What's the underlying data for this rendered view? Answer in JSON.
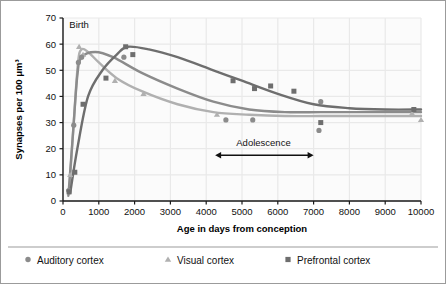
{
  "chart_data": {
    "type": "scatter",
    "title": "",
    "xlabel": "Age in days from conception",
    "ylabel": "Synapses per 100 μm³",
    "xlim": [
      0,
      10000
    ],
    "ylim": [
      0,
      70
    ],
    "xticks": [
      0,
      1000,
      2000,
      3000,
      4000,
      5000,
      6000,
      7000,
      8000,
      9000,
      10000
    ],
    "xtick_labels": [
      "0",
      "1000",
      "2000",
      "3000",
      "4000",
      "5000",
      "6000",
      "7000",
      "8000",
      "9000",
      "10000"
    ],
    "yticks": [
      0,
      10,
      20,
      30,
      40,
      50,
      60,
      70
    ],
    "ytick_labels": [
      "0",
      "10",
      "20",
      "30",
      "40",
      "50",
      "60",
      "70"
    ],
    "grid": true,
    "grid_color": "#e9e9e9",
    "legend_position": "below-plot",
    "annotations": [
      {
        "name": "birth",
        "text": "Birth",
        "x": 450,
        "y": 66
      },
      {
        "name": "adolescence",
        "text": "Adolescence",
        "x": 5600,
        "y": 21,
        "arrow": {
          "x_start": 4250,
          "x_end": 7000,
          "y": 17.5,
          "double_headed": true
        }
      }
    ],
    "series": [
      {
        "name": "Auditory cortex",
        "marker": "circle",
        "color": "#8b8b8b",
        "points": [
          {
            "x": 160,
            "y": 4
          },
          {
            "x": 300,
            "y": 29
          },
          {
            "x": 430,
            "y": 53
          },
          {
            "x": 520,
            "y": 55
          },
          {
            "x": 1700,
            "y": 55
          },
          {
            "x": 4550,
            "y": 31
          },
          {
            "x": 5300,
            "y": 31
          },
          {
            "x": 7150,
            "y": 27
          },
          {
            "x": 7200,
            "y": 38
          }
        ],
        "curve": [
          [
            150,
            2
          ],
          [
            280,
            26
          ],
          [
            400,
            48
          ],
          [
            520,
            55
          ],
          [
            900,
            57
          ],
          [
            1400,
            55
          ],
          [
            2200,
            49
          ],
          [
            3200,
            43
          ],
          [
            4200,
            38
          ],
          [
            5200,
            35
          ],
          [
            6200,
            34
          ],
          [
            7200,
            34
          ],
          [
            8200,
            34
          ],
          [
            9200,
            34
          ],
          [
            10000,
            34
          ]
        ]
      },
      {
        "name": "Visual cortex",
        "marker": "triangle",
        "color": "#b0b0b0",
        "points": [
          {
            "x": 200,
            "y": 10
          },
          {
            "x": 450,
            "y": 59
          },
          {
            "x": 560,
            "y": 56
          },
          {
            "x": 1450,
            "y": 46
          },
          {
            "x": 2250,
            "y": 41
          },
          {
            "x": 4300,
            "y": 33
          },
          {
            "x": 9750,
            "y": 33.5
          },
          {
            "x": 10000,
            "y": 31
          }
        ],
        "curve": [
          [
            170,
            3
          ],
          [
            300,
            30
          ],
          [
            420,
            53
          ],
          [
            520,
            58
          ],
          [
            700,
            57
          ],
          [
            1000,
            53
          ],
          [
            1500,
            47
          ],
          [
            2200,
            42
          ],
          [
            3200,
            37
          ],
          [
            4200,
            34
          ],
          [
            5200,
            33
          ],
          [
            6200,
            32.5
          ],
          [
            7200,
            32.5
          ],
          [
            8200,
            32.5
          ],
          [
            9200,
            32.5
          ],
          [
            10000,
            32.5
          ]
        ]
      },
      {
        "name": "Prefrontal cortex",
        "marker": "square",
        "color": "#6e6e6e",
        "points": [
          {
            "x": 170,
            "y": 3.5
          },
          {
            "x": 330,
            "y": 11
          },
          {
            "x": 560,
            "y": 37
          },
          {
            "x": 1200,
            "y": 47
          },
          {
            "x": 1750,
            "y": 59
          },
          {
            "x": 1950,
            "y": 56
          },
          {
            "x": 4750,
            "y": 46
          },
          {
            "x": 5350,
            "y": 43
          },
          {
            "x": 5800,
            "y": 44
          },
          {
            "x": 6450,
            "y": 42
          },
          {
            "x": 7200,
            "y": 30
          },
          {
            "x": 9800,
            "y": 35
          }
        ],
        "curve": [
          [
            200,
            3
          ],
          [
            400,
            20
          ],
          [
            700,
            40
          ],
          [
            1100,
            50
          ],
          [
            1500,
            56
          ],
          [
            1800,
            59
          ],
          [
            2400,
            58
          ],
          [
            3200,
            55
          ],
          [
            4200,
            50
          ],
          [
            5000,
            46
          ],
          [
            6000,
            41
          ],
          [
            7000,
            37
          ],
          [
            8000,
            35.5
          ],
          [
            9000,
            35
          ],
          [
            10000,
            35
          ]
        ]
      }
    ]
  },
  "legend": {
    "items": [
      {
        "label": "Auditory cortex",
        "marker": "circle",
        "color": "#8b8b8b"
      },
      {
        "label": "Visual cortex",
        "marker": "triangle",
        "color": "#b0b0b0"
      },
      {
        "label": "Prefrontal cortex",
        "marker": "square",
        "color": "#6e6e6e"
      }
    ]
  },
  "colors": {
    "auditory": "#8b8b8b",
    "visual": "#b0b0b0",
    "prefrontal": "#6e6e6e",
    "grid": "#e9e9e9",
    "axis": "#1a1a1a",
    "frame": "#9b9b9b",
    "text": "#111111"
  }
}
